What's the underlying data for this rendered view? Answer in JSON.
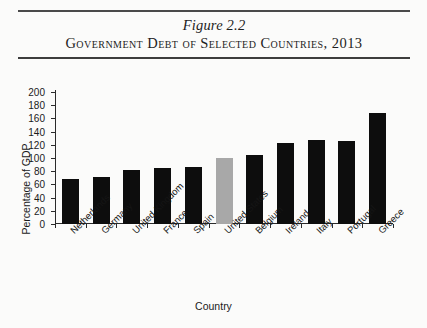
{
  "figure": {
    "number": "Figure 2.2",
    "title": "Government Debt of Selected Countries, 2013"
  },
  "chart_data": {
    "type": "bar",
    "title": "Government Debt of Selected Countries, 2013",
    "xlabel": "Country",
    "ylabel": "Percentage of GDP",
    "ylim": [
      0,
      200
    ],
    "yticks": [
      0,
      20,
      40,
      60,
      80,
      100,
      120,
      140,
      160,
      180,
      200
    ],
    "grid": false,
    "legend": "none",
    "categories": [
      "Netherlands",
      "Germany",
      "United Kingdom",
      "France",
      "Spain",
      "United States",
      "Belgium",
      "Ireland",
      "Italy",
      "Portugal",
      "Greece"
    ],
    "values": [
      68,
      71,
      82,
      85,
      86,
      100,
      105,
      123,
      127,
      126,
      168
    ],
    "bar_colors": [
      "#0d0d0d",
      "#0d0d0d",
      "#0d0d0d",
      "#0d0d0d",
      "#0d0d0d",
      "#a8a8a8",
      "#0d0d0d",
      "#0d0d0d",
      "#0d0d0d",
      "#0d0d0d",
      "#0d0d0d"
    ],
    "highlighted_category": "United States"
  }
}
